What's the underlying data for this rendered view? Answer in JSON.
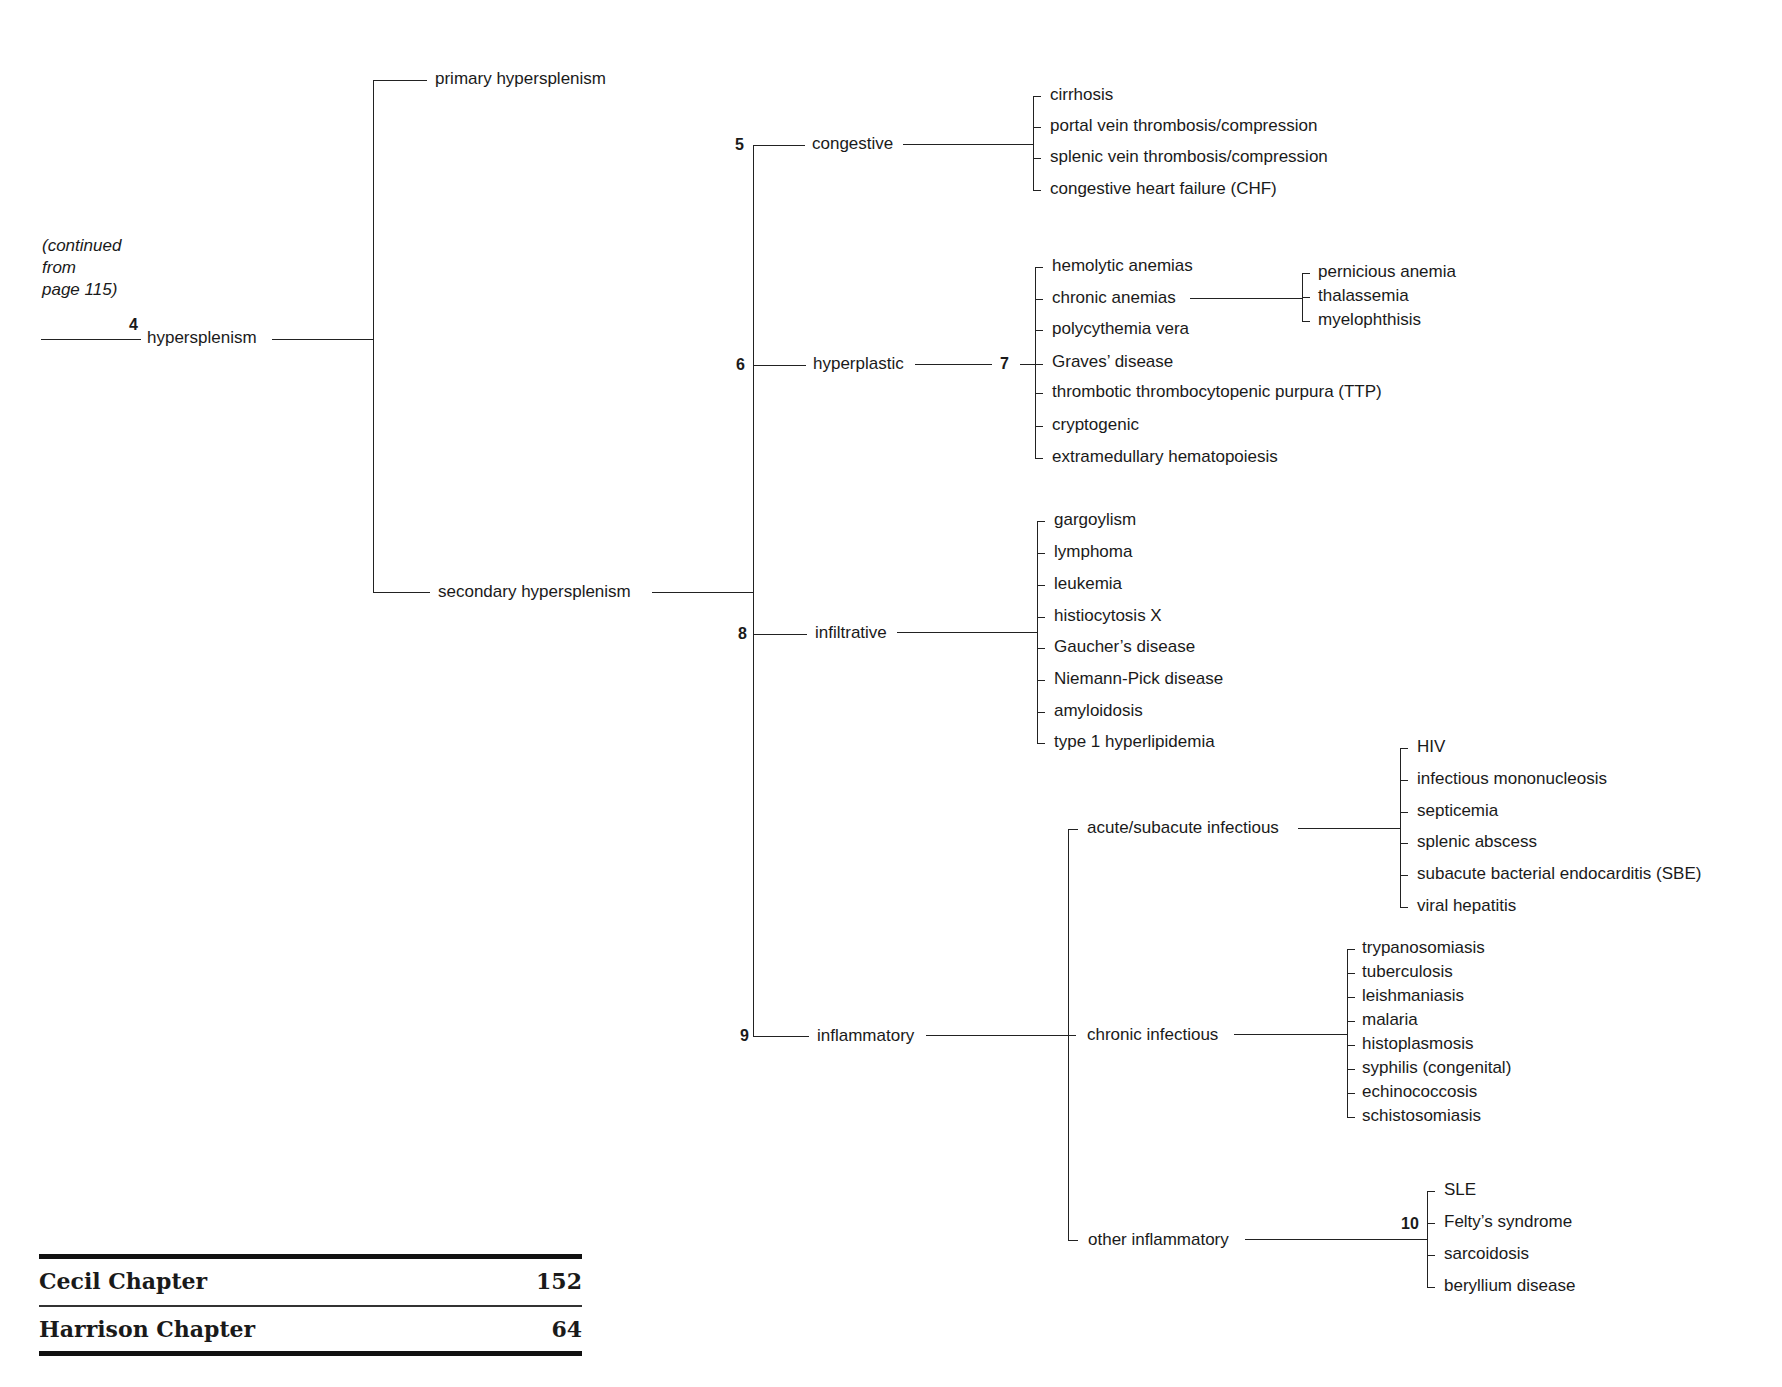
{
  "continued_note": [
    "(continued",
    "from",
    "page 115)"
  ],
  "root": {
    "number": "4",
    "label": "hypersplenism"
  },
  "level1": {
    "primary": "primary hypersplenism",
    "secondary": "secondary hypersplenism"
  },
  "categories": {
    "congestive": {
      "number": "5",
      "label": "congestive",
      "items": [
        "cirrhosis",
        "portal vein thrombosis/compression",
        "splenic vein thrombosis/compression",
        "congestive heart failure (CHF)"
      ]
    },
    "hyperplastic": {
      "number": "6",
      "label": "hyperplastic",
      "subnumber": "7",
      "items": [
        "hemolytic anemias",
        "chronic anemias",
        "polycythemia vera",
        "Graves’ disease",
        "thrombotic thrombocytopenic purpura (TTP)",
        "cryptogenic",
        "extramedullary hematopoiesis"
      ],
      "chronic_anemias": [
        "pernicious anemia",
        "thalassemia",
        "myelophthisis"
      ]
    },
    "infiltrative": {
      "number": "8",
      "label": "infiltrative",
      "items": [
        "gargoylism",
        "lymphoma",
        "leukemia",
        "histiocytosis X",
        "Gaucher’s disease",
        "Niemann-Pick disease",
        "amyloidosis",
        "type 1 hyperlipidemia"
      ]
    },
    "inflammatory": {
      "number": "9",
      "label": "inflammatory",
      "acute": {
        "label": "acute/subacute infectious",
        "items": [
          "HIV",
          "infectious mononucleosis",
          "septicemia",
          "splenic abscess",
          "subacute bacterial endocarditis (SBE)",
          "viral hepatitis"
        ]
      },
      "chronic": {
        "label": "chronic infectious",
        "items": [
          "trypanosomiasis",
          "tuberculosis",
          "leishmaniasis",
          "malaria",
          "histoplasmosis",
          "syphilis (congenital)",
          "echinococcosis",
          "schistosomiasis"
        ]
      },
      "other": {
        "label": "other inflammatory",
        "number": "10",
        "items": [
          "SLE",
          "Felty’s syndrome",
          "sarcoidosis",
          "beryllium disease"
        ]
      }
    }
  },
  "references": [
    {
      "label": "Cecil Chapter",
      "value": "152"
    },
    {
      "label": "Harrison Chapter",
      "value": "64"
    }
  ]
}
